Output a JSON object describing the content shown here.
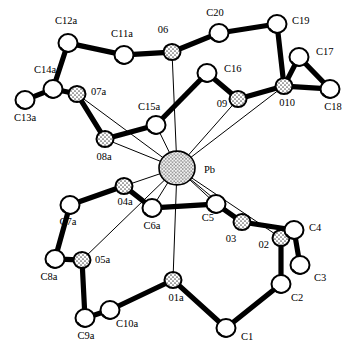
{
  "figure": {
    "central_metal": "Pb",
    "background_color": "#ffffff",
    "line_color": "#000000"
  },
  "chart_data": {
    "type": "scatter",
    "title": "",
    "xlabel": "",
    "ylabel": "",
    "grid": false,
    "legend": "none",
    "xlim": [
      0,
      360
    ],
    "ylim": [
      0,
      356
    ],
    "atom_kinds": {
      "Pb": {
        "kind": "metal",
        "radius": 18,
        "fill": "#e2e2e2",
        "shading": "stipple"
      },
      "O": {
        "kind": "oxygen",
        "radius": 8.5,
        "fill": "#dedede",
        "shading": "stipple"
      },
      "C": {
        "kind": "carbon",
        "radius": 9.5,
        "fill": "#ffffff",
        "shading": "open"
      }
    },
    "atoms": [
      {
        "id": "Pb",
        "element": "Pb",
        "x": 177,
        "y": 168,
        "r": 18,
        "label": "Pb",
        "lx": 204,
        "ly": 171,
        "anchor": "start"
      },
      {
        "id": "O6",
        "element": "O",
        "x": 172,
        "y": 52,
        "r": 8.5,
        "label": "06",
        "lx": 163,
        "ly": 31,
        "anchor": "middle"
      },
      {
        "id": "O7a",
        "element": "O",
        "x": 77,
        "y": 94,
        "r": 8.5,
        "label": "07a",
        "lx": 91,
        "ly": 93,
        "anchor": "start"
      },
      {
        "id": "O8a",
        "element": "O",
        "x": 105,
        "y": 139,
        "r": 8.5,
        "label": "08a",
        "lx": 104,
        "ly": 158,
        "anchor": "middle"
      },
      {
        "id": "O9",
        "element": "O",
        "x": 238,
        "y": 99,
        "r": 8.5,
        "label": "09",
        "lx": 222,
        "ly": 105,
        "anchor": "middle"
      },
      {
        "id": "O10",
        "element": "O",
        "x": 284,
        "y": 86,
        "r": 8.5,
        "label": "010",
        "lx": 287,
        "ly": 104,
        "anchor": "middle"
      },
      {
        "id": "O1a",
        "element": "O",
        "x": 173,
        "y": 280,
        "r": 8.5,
        "label": "01a",
        "lx": 176,
        "ly": 299,
        "anchor": "middle"
      },
      {
        "id": "O2",
        "element": "O",
        "x": 281,
        "y": 238,
        "r": 8.5,
        "label": "02",
        "lx": 269,
        "ly": 246,
        "anchor": "end"
      },
      {
        "id": "O3",
        "element": "O",
        "x": 242,
        "y": 222,
        "r": 8.5,
        "label": "03",
        "lx": 231,
        "ly": 240,
        "anchor": "middle"
      },
      {
        "id": "O4a",
        "element": "O",
        "x": 124,
        "y": 186,
        "r": 8.5,
        "label": "04a",
        "lx": 125,
        "ly": 203,
        "anchor": "middle"
      },
      {
        "id": "O5a",
        "element": "O",
        "x": 82,
        "y": 260,
        "r": 8.5,
        "label": "05a",
        "lx": 95,
        "ly": 261,
        "anchor": "start"
      },
      {
        "id": "C1",
        "element": "C",
        "x": 226,
        "y": 328,
        "r": 9.5,
        "label": "C1",
        "lx": 241,
        "ly": 338,
        "anchor": "start"
      },
      {
        "id": "C2",
        "element": "C",
        "x": 281,
        "y": 284,
        "r": 9.5,
        "label": "C2",
        "lx": 291,
        "ly": 299,
        "anchor": "start"
      },
      {
        "id": "C3",
        "element": "C",
        "x": 300,
        "y": 265,
        "r": 9.5,
        "label": "C3",
        "lx": 314,
        "ly": 279,
        "anchor": "start"
      },
      {
        "id": "C4",
        "element": "C",
        "x": 294,
        "y": 230,
        "r": 9.5,
        "label": "C4",
        "lx": 309,
        "ly": 229,
        "anchor": "start"
      },
      {
        "id": "C5",
        "element": "C",
        "x": 216,
        "y": 204,
        "r": 9.5,
        "label": "C5",
        "lx": 208,
        "ly": 219,
        "anchor": "middle"
      },
      {
        "id": "C6a",
        "element": "C",
        "x": 152,
        "y": 208,
        "r": 9.5,
        "label": "C6a",
        "lx": 152,
        "ly": 227,
        "anchor": "middle"
      },
      {
        "id": "C7a",
        "element": "C",
        "x": 70,
        "y": 205,
        "r": 9.5,
        "label": "C7a",
        "lx": 68,
        "ly": 223,
        "anchor": "middle"
      },
      {
        "id": "C8a",
        "element": "C",
        "x": 55,
        "y": 259,
        "r": 9.5,
        "label": "C8a",
        "lx": 49,
        "ly": 278,
        "anchor": "middle"
      },
      {
        "id": "C9a",
        "element": "C",
        "x": 85,
        "y": 318,
        "r": 9.5,
        "label": "C9a",
        "lx": 86,
        "ly": 337,
        "anchor": "middle"
      },
      {
        "id": "C10a",
        "element": "C",
        "x": 110,
        "y": 310,
        "r": 9.5,
        "label": "C10a",
        "lx": 127,
        "ly": 325,
        "anchor": "middle"
      },
      {
        "id": "C11a",
        "element": "C",
        "x": 124,
        "y": 55,
        "r": 9.5,
        "label": "C11a",
        "lx": 122,
        "ly": 35,
        "anchor": "middle"
      },
      {
        "id": "C12a",
        "element": "C",
        "x": 68,
        "y": 43,
        "r": 9.5,
        "label": "C12a",
        "lx": 66,
        "ly": 22,
        "anchor": "middle"
      },
      {
        "id": "C13a",
        "element": "C",
        "x": 25,
        "y": 100,
        "r": 9.5,
        "label": "C13a",
        "lx": 25,
        "ly": 119,
        "anchor": "middle"
      },
      {
        "id": "C14a",
        "element": "C",
        "x": 53,
        "y": 89,
        "r": 9.5,
        "label": "C14a",
        "lx": 45,
        "ly": 71,
        "anchor": "middle"
      },
      {
        "id": "C15a",
        "element": "C",
        "x": 156,
        "y": 125,
        "r": 9.5,
        "label": "C15a",
        "lx": 149,
        "ly": 108,
        "anchor": "middle"
      },
      {
        "id": "C16",
        "element": "C",
        "x": 207,
        "y": 73,
        "r": 9.5,
        "label": "C16",
        "lx": 224,
        "ly": 70,
        "anchor": "start"
      },
      {
        "id": "C17",
        "element": "C",
        "x": 299,
        "y": 57,
        "r": 9.5,
        "label": "C17",
        "lx": 316,
        "ly": 53,
        "anchor": "start"
      },
      {
        "id": "C18",
        "element": "C",
        "x": 330,
        "y": 89,
        "r": 9.5,
        "label": "C18",
        "lx": 333,
        "ly": 108,
        "anchor": "middle"
      },
      {
        "id": "C19",
        "element": "C",
        "x": 277,
        "y": 24,
        "r": 9.5,
        "label": "C19",
        "lx": 292,
        "ly": 22,
        "anchor": "start"
      },
      {
        "id": "C20",
        "element": "C",
        "x": 219,
        "y": 33,
        "r": 9.5,
        "label": "C20",
        "lx": 215,
        "ly": 14,
        "anchor": "middle"
      }
    ],
    "bonds_covalent": [
      {
        "a": "C12a",
        "b": "C11a"
      },
      {
        "a": "C11a",
        "b": "O6"
      },
      {
        "a": "C12a",
        "b": "C14a"
      },
      {
        "a": "C14a",
        "b": "C13a"
      },
      {
        "a": "C14a",
        "b": "O7a"
      },
      {
        "a": "O7a",
        "b": "O8a"
      },
      {
        "a": "O8a",
        "b": "C15a"
      },
      {
        "a": "O6",
        "b": "C20"
      },
      {
        "a": "C20",
        "b": "C19"
      },
      {
        "a": "C19",
        "b": "O10"
      },
      {
        "a": "O10",
        "b": "C17"
      },
      {
        "a": "C17",
        "b": "C18"
      },
      {
        "a": "O10",
        "b": "C18"
      },
      {
        "a": "C15a",
        "b": "C16"
      },
      {
        "a": "C16",
        "b": "O9"
      },
      {
        "a": "O9",
        "b": "O10"
      },
      {
        "a": "O4a",
        "b": "C7a"
      },
      {
        "a": "C7a",
        "b": "C8a"
      },
      {
        "a": "C8a",
        "b": "O5a"
      },
      {
        "a": "O5a",
        "b": "C9a"
      },
      {
        "a": "C9a",
        "b": "C10a"
      },
      {
        "a": "C10a",
        "b": "O1a"
      },
      {
        "a": "O4a",
        "b": "C6a"
      },
      {
        "a": "C6a",
        "b": "C5"
      },
      {
        "a": "C5",
        "b": "O3"
      },
      {
        "a": "O3",
        "b": "C4"
      },
      {
        "a": "C4",
        "b": "C3"
      },
      {
        "a": "C4",
        "b": "O2"
      },
      {
        "a": "O2",
        "b": "C2"
      },
      {
        "a": "C2",
        "b": "C1"
      },
      {
        "a": "C1",
        "b": "O1a"
      }
    ],
    "bonds_coordination": [
      {
        "a": "Pb",
        "b": "O6"
      },
      {
        "a": "Pb",
        "b": "O7a"
      },
      {
        "a": "Pb",
        "b": "O8a"
      },
      {
        "a": "Pb",
        "b": "O9"
      },
      {
        "a": "Pb",
        "b": "O10"
      },
      {
        "a": "Pb",
        "b": "O1a"
      },
      {
        "a": "Pb",
        "b": "O2"
      },
      {
        "a": "Pb",
        "b": "O3"
      },
      {
        "a": "Pb",
        "b": "O4a"
      },
      {
        "a": "Pb",
        "b": "O5a"
      },
      {
        "a": "Pb",
        "b": "C15a"
      },
      {
        "a": "Pb",
        "b": "C5"
      },
      {
        "a": "Pb",
        "b": "C6a"
      }
    ]
  }
}
